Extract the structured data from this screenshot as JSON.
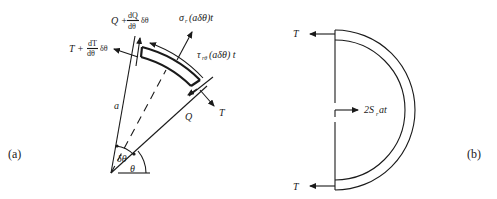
{
  "figure": {
    "panels": [
      {
        "id": "a",
        "caption": "(a)",
        "labels": {
          "radius": "a",
          "angle_theta": "θ",
          "angle_dtheta": "δθ",
          "tension_top": "T + dT/dθ δθ",
          "tension_top_main": "T +",
          "tension_top_num": "dT",
          "tension_top_den": "dθ",
          "tension_top_tail": "δθ",
          "shear_top_main": "Q +",
          "shear_top_num": "dQ",
          "shear_top_den": "dθ",
          "shear_top_tail": "δθ",
          "normal_stress": "σr(aδθ)t",
          "normal_stress_sym": "σ",
          "normal_stress_sub": "r",
          "normal_stress_tail": "(aδθ)t",
          "shear_stress": "τrθ(aδθ) t",
          "shear_stress_sym": "τ",
          "shear_stress_sub": "rθ",
          "shear_stress_tail": "(aδθ) t",
          "tension_bottom": "T",
          "shear_bottom": "Q"
        }
      },
      {
        "id": "b",
        "caption": "(b)",
        "labels": {
          "tension_upper": "T",
          "tension_lower": "T",
          "resultant": "2Sr at",
          "resultant_main": "2S",
          "resultant_sub": "r",
          "resultant_tail": " at"
        }
      }
    ]
  }
}
